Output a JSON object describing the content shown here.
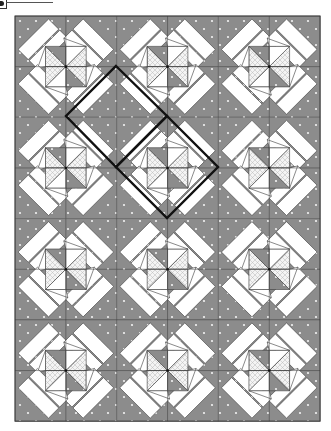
{
  "figure": {
    "type": "quilt-pattern-diagram"
  },
  "layout": {
    "origin": [
      15,
      16
    ],
    "columns": 3,
    "rows": 4,
    "block_width": 101.7,
    "block_height": 101.3
  },
  "colors": {
    "background": "#ffffff",
    "gray_fabric": "#8c8c8c",
    "gray_dot": "#f2f2f2",
    "white_fabric": "#ffffff",
    "crosshatch_base": "#f4f4f4",
    "crosshatch_line": "#b8b8b8",
    "seam_line": "#3a3a3a",
    "outline": "#111111"
  },
  "highlight_outlines": [
    {
      "name": "diamond-unit-1",
      "points": [
        [
          116,
          66
        ],
        [
          167,
          116
        ],
        [
          116,
          167
        ],
        [
          66,
          116
        ]
      ]
    },
    {
      "name": "diamond-unit-2",
      "points": [
        [
          167,
          116
        ],
        [
          218,
          167
        ],
        [
          167,
          218
        ],
        [
          116,
          167
        ]
      ]
    }
  ],
  "legend_marker": {
    "label": ""
  }
}
